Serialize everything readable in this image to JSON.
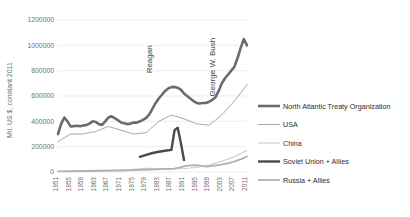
{
  "chart_data": {
    "type": "line",
    "title": "",
    "xlabel": "",
    "ylabel": "Mil. US $, constant 2011",
    "ylim": [
      0,
      1200000
    ],
    "xlim": [
      1951,
      2011
    ],
    "ytick_labels": [
      "0",
      "200000",
      "400000",
      "600000",
      "800000",
      "1000000",
      "1200000"
    ],
    "ytick_values": [
      0,
      200000,
      400000,
      600000,
      800000,
      1000000,
      1200000
    ],
    "xtick_labels": [
      "1951",
      "1955",
      "1959",
      "1963",
      "1967",
      "1971",
      "1975",
      "1979",
      "1983",
      "1987",
      "1991",
      "1995",
      "1999",
      "2003",
      "2007",
      "2011"
    ],
    "xtick_values": [
      1951,
      1955,
      1959,
      1963,
      1967,
      1971,
      1975,
      1979,
      1983,
      1987,
      1991,
      1995,
      1999,
      2003,
      2007,
      2011
    ],
    "grid": true,
    "legend_position": "right",
    "annotations": [
      {
        "text": "Reagan",
        "x": 1981,
        "y": 1000000,
        "rotation": -90
      },
      {
        "text": "George W. Bush",
        "x": 2001,
        "y": 1060000,
        "rotation": -90
      }
    ],
    "series": [
      {
        "name": "North Atlantic Treaty Organization",
        "color": "#6b6b6b",
        "width": 2.6,
        "x": [
          1951,
          1952,
          1953,
          1954,
          1955,
          1956,
          1957,
          1958,
          1959,
          1960,
          1961,
          1962,
          1963,
          1964,
          1965,
          1966,
          1967,
          1968,
          1969,
          1970,
          1971,
          1972,
          1973,
          1974,
          1975,
          1976,
          1977,
          1978,
          1979,
          1980,
          1981,
          1982,
          1983,
          1984,
          1985,
          1986,
          1987,
          1988,
          1989,
          1990,
          1991,
          1992,
          1993,
          1994,
          1995,
          1996,
          1997,
          1998,
          1999,
          2000,
          2001,
          2002,
          2003,
          2004,
          2005,
          2006,
          2007,
          2008,
          2009,
          2010,
          2011
        ],
        "values": [
          300000,
          380000,
          430000,
          400000,
          360000,
          362000,
          365000,
          362000,
          368000,
          370000,
          382000,
          400000,
          395000,
          378000,
          372000,
          400000,
          430000,
          440000,
          425000,
          410000,
          390000,
          385000,
          378000,
          382000,
          390000,
          390000,
          400000,
          412000,
          428000,
          455000,
          500000,
          545000,
          580000,
          610000,
          640000,
          660000,
          670000,
          672000,
          665000,
          650000,
          620000,
          600000,
          580000,
          560000,
          545000,
          540000,
          545000,
          545000,
          555000,
          570000,
          590000,
          640000,
          700000,
          740000,
          770000,
          800000,
          830000,
          900000,
          980000,
          1050000,
          1000000
        ]
      },
      {
        "name": "USA",
        "color": "#a8a8a8",
        "width": 1.0,
        "x": [
          1951,
          1955,
          1959,
          1963,
          1967,
          1971,
          1975,
          1979,
          1983,
          1987,
          1991,
          1995,
          1999,
          2003,
          2007,
          2011
        ],
        "values": [
          240000,
          300000,
          300000,
          320000,
          360000,
          330000,
          300000,
          310000,
          400000,
          450000,
          420000,
          380000,
          370000,
          450000,
          560000,
          690000
        ]
      },
      {
        "name": "China",
        "color": "#c9c9c9",
        "width": 1.1,
        "x": [
          1975,
          1979,
          1983,
          1987,
          1991,
          1995,
          1999,
          2003,
          2007,
          2011
        ],
        "values": [
          22000,
          30000,
          28000,
          25000,
          28000,
          35000,
          55000,
          85000,
          120000,
          170000
        ]
      },
      {
        "name": "Soviet Union + Allies",
        "color": "#4a4a4a",
        "width": 2.4,
        "x": [
          1977,
          1979,
          1981,
          1983,
          1985,
          1987,
          1988,
          1989,
          1990,
          1991
        ],
        "values": [
          120000,
          135000,
          150000,
          160000,
          168000,
          175000,
          330000,
          350000,
          230000,
          95000
        ]
      },
      {
        "name": "Russia + Allies",
        "color": "#b0b0b0",
        "width": 1.8,
        "x": [
          1951,
          1960,
          1970,
          1980,
          1988,
          1992,
          1995,
          1998,
          2000,
          2003,
          2006,
          2008,
          2010,
          2011
        ],
        "values": [
          5000,
          8000,
          12000,
          18000,
          26000,
          50000,
          55000,
          42000,
          48000,
          58000,
          75000,
          92000,
          110000,
          125000
        ]
      }
    ]
  },
  "legend": {
    "items": [
      {
        "label": "North Atlantic Treaty Organization"
      },
      {
        "label": "USA"
      },
      {
        "label": "China"
      },
      {
        "label": "Soviet Union + Allies"
      },
      {
        "label": "Russia + Allies"
      }
    ]
  }
}
